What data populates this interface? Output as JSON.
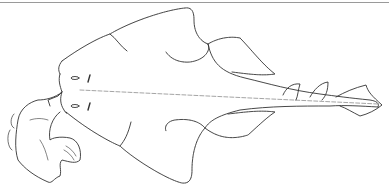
{
  "illustration": {
    "subject": "angel shark, dorsal view, line drawing",
    "stroke_color": "#333333",
    "background": "#ffffff",
    "rule_color": "#9a9a9a"
  }
}
